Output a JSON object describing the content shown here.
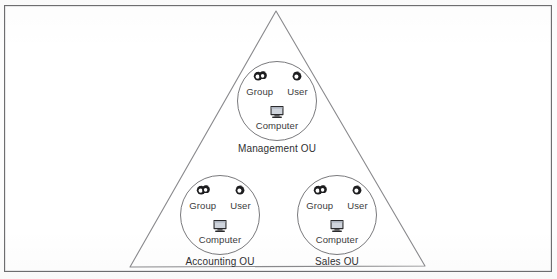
{
  "diagram": {
    "shape": "triangle",
    "frame": {
      "border_color": "#6e6e70",
      "background": "#ffffff"
    },
    "triangle": {
      "stroke_color": "#8a8a8d",
      "apex": {
        "x": 276,
        "y": 11
      },
      "bottom_left": {
        "x": 130,
        "y": 267
      },
      "bottom_right": {
        "x": 425,
        "y": 266
      }
    },
    "icon_labels": {
      "group": "Group",
      "user": "User",
      "computer": "Computer"
    },
    "icon_names": {
      "group": "group-icon",
      "user": "user-icon",
      "computer": "computer-icon"
    },
    "nodes": [
      {
        "id": "management",
        "label": "Management OU",
        "center": {
          "x": 277,
          "y": 101
        },
        "radius": 40,
        "label_position": {
          "x": 277,
          "y": 148
        }
      },
      {
        "id": "accounting",
        "label": "Accounting OU",
        "center": {
          "x": 220,
          "y": 215
        },
        "radius": 40,
        "label_position": {
          "x": 220,
          "y": 261
        }
      },
      {
        "id": "sales",
        "label": "Sales OU",
        "center": {
          "x": 337,
          "y": 215
        },
        "radius": 40,
        "label_position": {
          "x": 337,
          "y": 261
        }
      }
    ]
  }
}
